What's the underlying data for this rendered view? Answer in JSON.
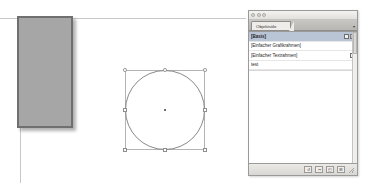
{
  "app": {
    "document_background": "#ffffff"
  },
  "canvas": {
    "objects": {
      "rectangle": {
        "name": "gray-rectangle",
        "fill_color": "#a6a6a6",
        "stroke_color": "#6f6f6f",
        "has_drop_shadow": true
      },
      "ellipse": {
        "name": "ellipse",
        "stroke_color": "#8a8a8a",
        "selected": true,
        "handle_count": 8,
        "center_point_visible": true
      }
    }
  },
  "panel": {
    "window_buttons": [
      "close",
      "minimize",
      "zoom"
    ],
    "tab_label": "Objektstile",
    "menu_icon": "panel-menu-icon",
    "styles": [
      {
        "label": "[Basis]",
        "selected": true,
        "icons": [
          "frame-icon",
          "pencil-icon"
        ]
      },
      {
        "label": "[Einfacher Grafikrahmen]",
        "selected": false,
        "icons": []
      },
      {
        "label": "[Einfacher Textrahmen]",
        "selected": false,
        "icons": [
          "text-frame-icon"
        ]
      },
      {
        "label": "test",
        "selected": false,
        "icons": []
      }
    ],
    "toolbar_buttons": [
      {
        "name": "clear-overrides-button",
        "glyph": "↺"
      },
      {
        "name": "break-link-to-style-button",
        "glyph": "✂"
      },
      {
        "name": "new-style-button",
        "glyph": "◰"
      },
      {
        "name": "delete-style-button",
        "glyph": "☒"
      }
    ],
    "colors": {
      "chrome": "#eceae6",
      "selection": "#b9c4d4",
      "border": "#9a9a9a"
    }
  }
}
